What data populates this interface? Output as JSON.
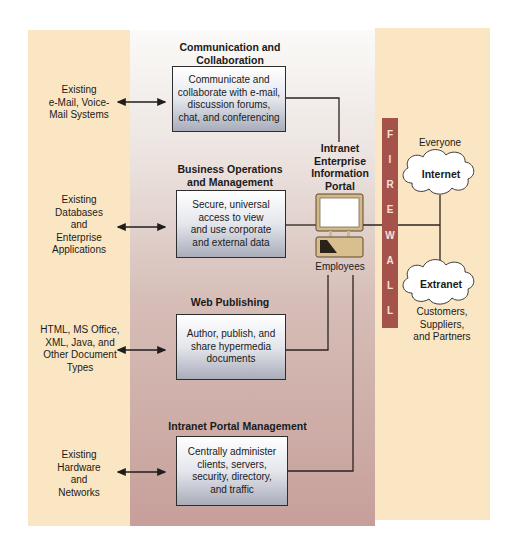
{
  "diagram": {
    "type": "intranet-enterprise-information-portal",
    "colors": {
      "outer_panel": "#fbe6c3",
      "firewall": "#a5514c",
      "box_gradient_top": "#ffffff",
      "box_gradient_bottom": "#a9adba",
      "lines": "#2d2320"
    },
    "sections": [
      {
        "heading": "Communication and Collaboration",
        "heading_lines": [
          "Communication and",
          "Collaboration"
        ],
        "box_lines": [
          "Communicate and",
          "collaborate with e-mail,",
          "discussion forums,",
          "chat, and conferencing"
        ],
        "external": [
          "Existing",
          "e-Mail, Voice-",
          "Mail Systems"
        ]
      },
      {
        "heading": "Business Operations and Management",
        "heading_lines": [
          "Business Operations",
          "and Management"
        ],
        "box_lines": [
          "Secure, universal",
          "access to view",
          "and use corporate",
          "and external data"
        ],
        "external": [
          "Existing",
          "Databases",
          "and",
          "Enterprise",
          "Applications"
        ]
      },
      {
        "heading": "Web Publishing",
        "heading_lines": [
          "Web Publishing"
        ],
        "box_lines": [
          "Author, publish, and",
          "share hypermedia",
          "documents"
        ],
        "external": [
          "HTML, MS Office,",
          "XML, Java, and",
          "Other Document",
          "Types"
        ]
      },
      {
        "heading": "Intranet Portal Management",
        "heading_lines": [
          "Intranet Portal Management"
        ],
        "box_lines": [
          "Centrally administer",
          "clients, servers,",
          "security, directory,",
          "and traffic"
        ],
        "external": [
          "Existing",
          "Hardware",
          "and",
          "Networks"
        ]
      }
    ],
    "portal": {
      "title_lines": [
        "Intranet",
        "Enterprise",
        "Information",
        "Portal"
      ],
      "users_label": "Employees"
    },
    "firewall": {
      "letters": [
        "F",
        "I",
        "R",
        "E",
        "W",
        "A",
        "L",
        "L"
      ]
    },
    "networks": {
      "internet": {
        "label": "Internet",
        "audience": "Everyone"
      },
      "extranet": {
        "label": "Extranet",
        "audience_lines": [
          "Customers,",
          "Suppliers,",
          "and Partners"
        ]
      }
    }
  }
}
